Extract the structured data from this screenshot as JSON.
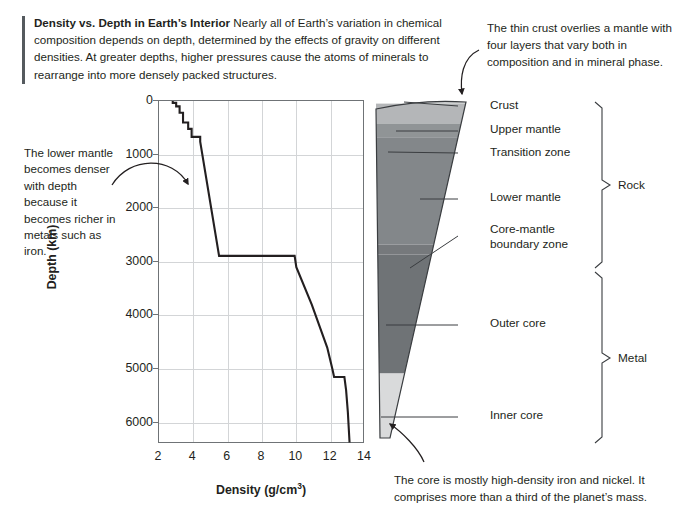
{
  "header": {
    "title": "Density vs. Depth in Earth’s Interior",
    "body": "Nearly all of Earth’s variation in chemical composition depends on depth, determined by the effects of gravity on different densities. At greater depths, higher pressures cause the atoms of minerals to rearrange into more densely packed structures."
  },
  "annotations": {
    "crust_note": "The thin crust overlies a mantle with four layers that vary both in composition and in mineral phase.",
    "mantle_note": "The lower mantle becomes denser with depth because it becomes richer in metals such as iron.",
    "core_note": "The core is mostly high-density iron and nickel. It comprises more than a third of the planet’s mass."
  },
  "chart_data": {
    "type": "line",
    "title": "Density vs. Depth in Earth’s Interior",
    "xlabel": "Density (g/cm³)",
    "ylabel": "Depth (km)",
    "xlim": [
      2,
      14
    ],
    "ylim": [
      0,
      6400
    ],
    "y_inverted": true,
    "grid": true,
    "legend_position": "none",
    "xticks": [
      2,
      4,
      6,
      8,
      10,
      12,
      14
    ],
    "yticks": [
      0,
      1000,
      2000,
      3000,
      4000,
      5000,
      6000
    ],
    "xtick_labels": [
      "2",
      "4",
      "6",
      "8",
      "10",
      "12",
      "14"
    ],
    "ytick_labels": [
      "0",
      "1000",
      "2000",
      "3000",
      "4000",
      "5000",
      "6000"
    ],
    "series": [
      {
        "name": "Density",
        "units_x": "g/cm^3",
        "units_y": "km",
        "points": [
          [
            2.8,
            0
          ],
          [
            2.8,
            35
          ],
          [
            3.0,
            35
          ],
          [
            3.0,
            100
          ],
          [
            3.2,
            100
          ],
          [
            3.2,
            220
          ],
          [
            3.4,
            220
          ],
          [
            3.4,
            400
          ],
          [
            3.7,
            400
          ],
          [
            3.7,
            520
          ],
          [
            3.9,
            520
          ],
          [
            3.9,
            670
          ],
          [
            4.4,
            670
          ],
          [
            4.4,
            760
          ],
          [
            5.5,
            2890
          ],
          [
            9.9,
            2890
          ],
          [
            10.0,
            3100
          ],
          [
            10.9,
            3800
          ],
          [
            11.8,
            4600
          ],
          [
            12.1,
            5000
          ],
          [
            12.2,
            5150
          ],
          [
            12.8,
            5150
          ],
          [
            12.9,
            5400
          ],
          [
            13.0,
            5800
          ],
          [
            13.1,
            6371
          ]
        ]
      }
    ]
  },
  "wedge": {
    "layers": [
      {
        "name": "Crust",
        "label": "Crust",
        "depth_top_km": 0,
        "depth_bottom_km": 35,
        "color": "#c9cbcc"
      },
      {
        "name": "Upper mantle",
        "label": "Upper mantle",
        "depth_top_km": 35,
        "depth_bottom_km": 410,
        "color": "#b4b6b8"
      },
      {
        "name": "Transition zone",
        "label": "Transition zone",
        "depth_top_km": 410,
        "depth_bottom_km": 670,
        "color": "#909496"
      },
      {
        "name": "Lower mantle",
        "label": "Lower mantle",
        "depth_top_km": 670,
        "depth_bottom_km": 2700,
        "color": "#83878a"
      },
      {
        "name": "Core-mantle boundary zone",
        "label": "Core-mantle boundary zone",
        "depth_top_km": 2700,
        "depth_bottom_km": 2890,
        "color": "#76797c"
      },
      {
        "name": "Outer core",
        "label": "Outer core",
        "depth_top_km": 2890,
        "depth_bottom_km": 5150,
        "color": "#6f7376"
      },
      {
        "name": "Inner core",
        "label": "Inner core",
        "depth_top_km": 5150,
        "depth_bottom_km": 6371,
        "color": "#d9dadb"
      }
    ],
    "groups": [
      {
        "label": "Rock",
        "from_km": 0,
        "to_km": 2890
      },
      {
        "label": "Metal",
        "from_km": 2890,
        "to_km": 6371
      }
    ]
  },
  "colors": {
    "axis": "#6f7376",
    "grid": "#d3d5d7",
    "curve": "#231f20",
    "text": "#231f20",
    "rule": "#555a5e"
  }
}
